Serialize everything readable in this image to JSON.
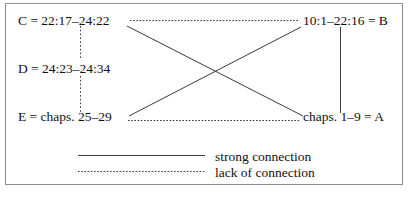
{
  "diagram": {
    "type": "relationship-diagram",
    "nodes": [
      {
        "id": "C",
        "label": "C = 22:17–24:22",
        "position": "top-left"
      },
      {
        "id": "D",
        "label": "D = 24:23–24:34",
        "position": "middle-left"
      },
      {
        "id": "E",
        "label": "E = chaps. 25–29",
        "position": "bottom-left"
      },
      {
        "id": "B",
        "label": "10:1–22:16 = B",
        "position": "top-right"
      },
      {
        "id": "A",
        "label": "chaps. 1–9 = A",
        "position": "bottom-right"
      }
    ],
    "edges": [
      {
        "from": "C",
        "to": "B",
        "style": "dotted",
        "meaning": "lack of connection"
      },
      {
        "from": "E",
        "to": "A",
        "style": "dotted",
        "meaning": "lack of connection"
      },
      {
        "from": "C",
        "to": "D",
        "style": "dotted",
        "meaning": "lack of connection"
      },
      {
        "from": "D",
        "to": "E",
        "style": "dotted",
        "meaning": "lack of connection"
      },
      {
        "from": "B",
        "to": "A",
        "style": "solid",
        "meaning": "strong connection"
      },
      {
        "from": "C",
        "to": "A",
        "style": "solid",
        "meaning": "strong connection"
      },
      {
        "from": "E",
        "to": "B",
        "style": "solid",
        "meaning": "strong connection"
      }
    ]
  },
  "legend": {
    "items": [
      {
        "style": "solid",
        "label": "strong connection"
      },
      {
        "style": "dotted",
        "label": "lack of connection"
      }
    ]
  },
  "colors": {
    "line": "#3a3a3a",
    "border": "#8c8c8c",
    "text": "#101010",
    "background": "#ffffff"
  }
}
